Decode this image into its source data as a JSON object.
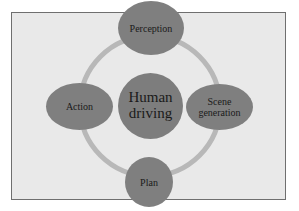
{
  "diagram": {
    "type": "cycle",
    "center": {
      "label": "Human\ndriving"
    },
    "nodes": [
      {
        "id": "perception",
        "label": "Perception",
        "position": "top"
      },
      {
        "id": "scene_generation",
        "label": "Scene\ngeneration",
        "position": "right"
      },
      {
        "id": "plan",
        "label": "Plan",
        "position": "bottom"
      },
      {
        "id": "action",
        "label": "Action",
        "position": "left"
      }
    ],
    "colors": {
      "background": "#e9e9e9",
      "frame_border": "#6f6f6f",
      "node_fill": "#7f7f7f",
      "ring": "#b8b8b8",
      "text": "#1a1a1a"
    }
  }
}
